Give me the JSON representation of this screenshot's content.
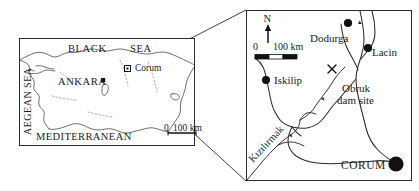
{
  "figure": {
    "type": "location-map"
  },
  "overview_panel": {
    "name": "turkey-overview-map",
    "labels": {
      "black_sea": "BLACK",
      "black_sea_2": "SEA",
      "aegean_sea": "AEGEAN SEA",
      "mediterranean": "MEDITERRANEAN",
      "capital": "ANKARA",
      "inset_site": "Corum"
    },
    "scale": {
      "zero": "0",
      "distance": "100 km"
    }
  },
  "detail_panel": {
    "name": "corum-detail-map",
    "north_arrow_label": "N",
    "scale": {
      "zero": "0",
      "distance": "100 km"
    },
    "places": [
      {
        "label": "Dodurga",
        "marker": "filled-circle"
      },
      {
        "label": "Lacin",
        "marker": "filled-circle"
      },
      {
        "label": "Iskilip",
        "marker": "filled-circle"
      },
      {
        "label": "CORUM",
        "marker": "large-filled-circle"
      }
    ],
    "dam_site": {
      "label_line1": "Obruk",
      "label_line2": "dam site",
      "marker": "x-cross"
    },
    "river": {
      "label": "Kızılırmak"
    }
  },
  "colors": {
    "ink": "#1a1a1a",
    "coastline": "#3a3a3a",
    "background": "#ffffff"
  }
}
